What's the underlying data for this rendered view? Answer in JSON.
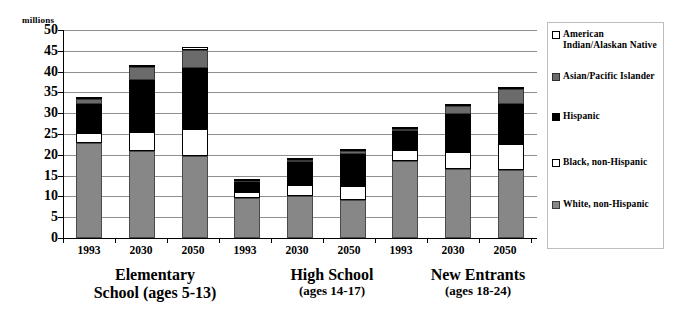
{
  "chart_data": {
    "type": "bar",
    "stacked": true,
    "title": "",
    "subtitle": "",
    "xlabel": "",
    "ylabel": "millions",
    "ylim": [
      0,
      50
    ],
    "ytick_step": 5,
    "yticks": [
      "50",
      "45",
      "40",
      "35",
      "30",
      "25",
      "20",
      "15",
      "10",
      "5",
      "0"
    ],
    "grid": true,
    "legend_position": "right",
    "categories": [
      "1993",
      "2030",
      "2050",
      "1993",
      "2030",
      "2050",
      "1993",
      "2030",
      "2050"
    ],
    "groups": [
      {
        "main": "Elementary School",
        "line1": "Elementary",
        "line2": "School (ages 5-13)",
        "sub": "(ages 5-13)",
        "categories": [
          "1993",
          "2030",
          "2050"
        ]
      },
      {
        "main": "High School",
        "line1": "High School",
        "line2": "(ages 14-17)",
        "sub": "(ages 14-17)",
        "categories": [
          "1993",
          "2030",
          "2050"
        ]
      },
      {
        "main": "New Entrants",
        "line1": "New Entrants",
        "line2": "(ages 18-24)",
        "sub": "(ages 18-24)",
        "categories": [
          "1993",
          "2030",
          "2050"
        ]
      }
    ],
    "series": [
      {
        "name": "White, non-Hispanic",
        "key": "white-nh",
        "color": "#878787",
        "values": [
          22.8,
          20.9,
          19.6,
          9.7,
          10.1,
          9.2,
          18.5,
          16.7,
          16.3
        ]
      },
      {
        "name": "Black, non-Hispanic",
        "key": "black-nh",
        "color": "#ffffff",
        "values": [
          2.5,
          4.5,
          6.6,
          1.3,
          2.6,
          3.3,
          2.7,
          3.9,
          6.2
        ]
      },
      {
        "name": "Hispanic",
        "key": "hispanic",
        "color": "#000000",
        "values": [
          7.0,
          12.6,
          14.6,
          2.4,
          5.5,
          7.6,
          4.6,
          9.2,
          9.8
        ]
      },
      {
        "name": "Asian/Pacific Islander",
        "key": "asian-pacific",
        "color": "#6b6b6b",
        "values": [
          1.0,
          3.0,
          4.5,
          0.4,
          0.6,
          0.7,
          0.5,
          2.0,
          3.5
        ]
      },
      {
        "name": "American Indian/Alaskan Native",
        "key": "american-indian",
        "color": "#ffffff",
        "values": [
          0.2,
          0.5,
          0.5,
          0.2,
          0.2,
          0.2,
          0.1,
          0.2,
          0.2
        ]
      }
    ],
    "totals": [
      33.5,
      41.5,
      45.8,
      14.0,
      19.0,
      21.0,
      26.4,
      32.0,
      36.0
    ]
  },
  "legend": {
    "items": [
      {
        "label": "American Indian/Alaskan Native",
        "swatch": "amind"
      },
      {
        "label": "Asian/Pacific Islander",
        "swatch": "asian"
      },
      {
        "label": "Hispanic",
        "swatch": "hisp"
      },
      {
        "label": "Black, non-Hispanic",
        "swatch": "blacknh"
      },
      {
        "label": "White, non-Hispanic",
        "swatch": "whitenh"
      }
    ]
  }
}
